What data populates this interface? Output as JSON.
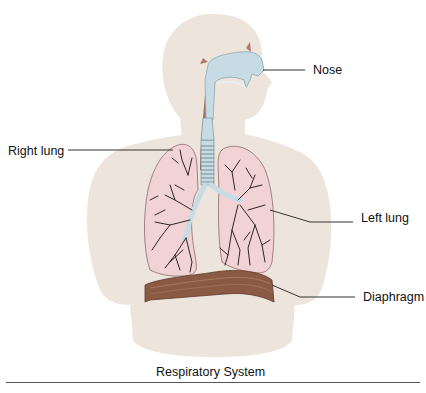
{
  "diagram": {
    "title": "Respiratory System",
    "labels": {
      "nose": "Nose",
      "right_lung": "Right lung",
      "left_lung": "Left lung",
      "diaphragm": "Diaphragm"
    },
    "colors": {
      "body": "#ede5dc",
      "lung": "#f1d3d5",
      "lung_outline": "#8a6a6a",
      "bronchi": "#2d2520",
      "airway": "#c6dbe4",
      "diaphragm": "#8a5a45",
      "esophagus": "#9b6a5e",
      "leader_line": "#333333"
    }
  }
}
